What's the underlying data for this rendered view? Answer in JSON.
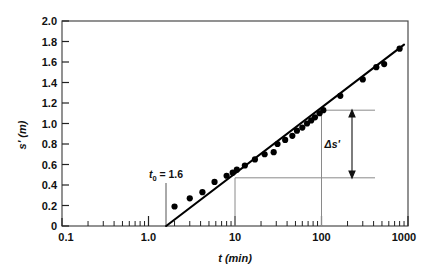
{
  "chart_data": {
    "type": "scatter",
    "title": "",
    "subtitle": "",
    "xlabel": "t (min)",
    "ylabel": "s' (m)",
    "xscale": "log",
    "yscale": "linear",
    "xlim": [
      0.1,
      1000
    ],
    "ylim": [
      0,
      2.0
    ],
    "grid": false,
    "legend": null,
    "x_tick_labels": [
      "0.1",
      "1.0",
      "10",
      "100",
      "1000"
    ],
    "x_tick_values": [
      0.1,
      1.0,
      10,
      100,
      1000
    ],
    "y_tick_labels": [
      "0",
      "0.2",
      "0.4",
      "0.6",
      "0.8",
      "1.0",
      "1.2",
      "1.4",
      "1.6",
      "1.8",
      "2.0"
    ],
    "y_tick_values": [
      0,
      0.2,
      0.4,
      0.6,
      0.8,
      1.0,
      1.2,
      1.4,
      1.6,
      1.8,
      2.0
    ],
    "series": [
      {
        "name": "settlement observations",
        "marker": "filled-circle",
        "points": [
          [
            2.0,
            0.19
          ],
          [
            3.0,
            0.27
          ],
          [
            4.2,
            0.33
          ],
          [
            5.8,
            0.43
          ],
          [
            8.0,
            0.49
          ],
          [
            9.4,
            0.52
          ],
          [
            10.5,
            0.55
          ],
          [
            13.0,
            0.59
          ],
          [
            17.0,
            0.65
          ],
          [
            22.0,
            0.7
          ],
          [
            28.0,
            0.72
          ],
          [
            31.0,
            0.8
          ],
          [
            38.0,
            0.84
          ],
          [
            46.0,
            0.88
          ],
          [
            52.0,
            0.93
          ],
          [
            60.0,
            0.96
          ],
          [
            68.0,
            1.0
          ],
          [
            76.0,
            1.03
          ],
          [
            84.0,
            1.06
          ],
          [
            95.0,
            1.1
          ],
          [
            105.0,
            1.13
          ],
          [
            165.0,
            1.27
          ],
          [
            300.0,
            1.43
          ],
          [
            430.0,
            1.55
          ],
          [
            530.0,
            1.58
          ],
          [
            800.0,
            1.73
          ]
        ]
      }
    ],
    "fit_line": {
      "name": "semi-log straight-line fit",
      "x_start": 1.6,
      "y_start": 0.0,
      "x_end": 900.0,
      "y_end": 1.77,
      "slope_per_log_cycle": 0.66
    },
    "annotations": [
      {
        "name": "t0-marker",
        "label": "t",
        "label_sub": "0",
        "label_value": " = 1.6",
        "text": "t0 = 1.6",
        "x": 1.6,
        "y_from": 0.0,
        "y_to": 0.42
      },
      {
        "name": "delta-s-bracket",
        "text": "Δs'",
        "lower_x": 10,
        "lower_y": 0.47,
        "upper_x": 100,
        "upper_y": 1.13,
        "value": 0.66
      }
    ]
  },
  "colors": {
    "ink": "#111111",
    "frame": "#3a3a3a",
    "marker": "#000000",
    "construction_line": "#6e6e6e",
    "background": "#ffffff"
  }
}
